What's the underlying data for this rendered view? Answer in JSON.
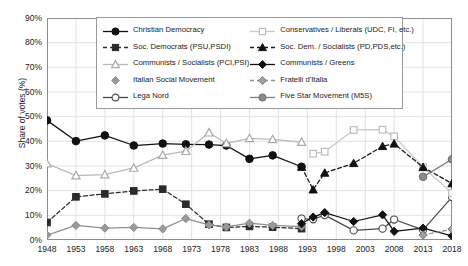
{
  "chart_data": {
    "type": "line",
    "title": "",
    "xlabel": "",
    "ylabel": "Share of votes (%)",
    "ylim": [
      0,
      90
    ],
    "ytick_labels": [
      "90%",
      "80%",
      "70%",
      "60%",
      "50%",
      "40%",
      "30%",
      "20%",
      "10%",
      "0%"
    ],
    "ytick_values": [
      90,
      80,
      70,
      60,
      50,
      40,
      30,
      20,
      10,
      0
    ],
    "grid": true,
    "legend_position": "upper-center",
    "categories": [
      1948,
      1953,
      1958,
      1963,
      1968,
      1973,
      1978,
      1983,
      1988,
      1993,
      1998,
      2003,
      2008,
      2013,
      2018
    ],
    "x": [
      1948,
      1953,
      1958,
      1963,
      1968,
      1972,
      1976,
      1979,
      1983,
      1987,
      1992,
      1994,
      1996,
      2001,
      2006,
      2008,
      2013,
      2018
    ],
    "series": [
      {
        "name": "Christian Democracy",
        "marker": "filled-circle",
        "color": "#111111",
        "line": "solid",
        "x": [
          1948,
          1953,
          1958,
          1963,
          1968,
          1972,
          1976,
          1979,
          1983,
          1987,
          1992
        ],
        "values": [
          48.5,
          40.1,
          42.4,
          38.3,
          39.1,
          38.8,
          38.7,
          38.3,
          32.9,
          34.3,
          29.7
        ]
      },
      {
        "name": "Soc. Democrats (PSU,PSDI)",
        "marker": "filled-square",
        "color": "#2b2b2b",
        "line": "dashed",
        "x": [
          1948,
          1953,
          1958,
          1963,
          1968,
          1972,
          1976,
          1979,
          1983,
          1987,
          1992
        ],
        "values": [
          7.1,
          17.5,
          18.7,
          19.9,
          20.6,
          14.5,
          6.4,
          5.1,
          5.5,
          5.2,
          4.6
        ]
      },
      {
        "name": "Communists / Socialists (PCI,PSI)",
        "marker": "open-triangle",
        "color": "#b8b8b8",
        "line": "solid",
        "x": [
          1948,
          1953,
          1958,
          1963,
          1968,
          1972,
          1976,
          1979,
          1983,
          1987,
          1992
        ],
        "values": [
          31.0,
          26.1,
          26.5,
          29.2,
          34.4,
          36.0,
          43.5,
          39.2,
          41.2,
          40.8,
          39.7
        ]
      },
      {
        "name": "Italian Social Movement",
        "marker": "filled-diamond-gray",
        "color": "#8e8e8e",
        "line": "solid",
        "x": [
          1948,
          1953,
          1958,
          1963,
          1968,
          1972,
          1976,
          1979,
          1983,
          1987,
          1992
        ],
        "values": [
          2.0,
          5.9,
          4.8,
          5.1,
          4.5,
          8.7,
          6.1,
          5.3,
          6.8,
          5.9,
          5.4
        ]
      },
      {
        "name": "Lega Nord",
        "marker": "open-circle",
        "color": "#4a4a4a",
        "line": "solid",
        "x": [
          1992,
          1994,
          1996,
          2001,
          2006,
          2008,
          2013,
          2018
        ],
        "values": [
          8.7,
          8.4,
          10.1,
          3.9,
          4.6,
          8.3,
          4.1,
          17.4
        ]
      },
      {
        "name": "Conservatives / Liberals (UDC, FI, etc.)",
        "marker": "open-square",
        "color": "#c9c9c9",
        "line": "solid",
        "x": [
          1994,
          1996,
          2001,
          2006,
          2008,
          2013,
          2018
        ],
        "values": [
          35.0,
          35.8,
          44.6,
          44.7,
          42.0,
          29.5,
          19.0
        ]
      },
      {
        "name": "Soc. Dem. / Socialists (PD,PDS,etc.)",
        "marker": "filled-triangle",
        "color": "#1a1a1a",
        "line": "dashed",
        "x": [
          1992,
          1994,
          1996,
          2001,
          2006,
          2008,
          2013,
          2018
        ],
        "values": [
          29.6,
          20.4,
          27.2,
          31.1,
          38.0,
          39.0,
          29.5,
          22.9
        ]
      },
      {
        "name": "Communists / Greens",
        "marker": "filled-diamond",
        "color": "#111111",
        "line": "solid",
        "x": [
          1992,
          1994,
          1996,
          2001,
          2006,
          2008,
          2013,
          2018
        ],
        "values": [
          6.6,
          9.3,
          11.1,
          7.5,
          10.2,
          3.5,
          4.8,
          1.7
        ]
      },
      {
        "name": "Fratelli d'Italia",
        "marker": "gray-diamond-open",
        "color": "#8e8e8e",
        "line": "dashed",
        "x": [
          2013,
          2018
        ],
        "values": [
          2.0,
          4.4
        ]
      },
      {
        "name": "Five Star Movement (M5S)",
        "marker": "gray-circle",
        "color": "#7d7d7d",
        "line": "solid",
        "x": [
          2013,
          2018
        ],
        "values": [
          25.6,
          32.7
        ]
      }
    ]
  },
  "legend": {
    "columns": [
      {
        "items": [
          {
            "label": "Christian Democracy",
            "marker": "filled-circle",
            "line": "solid",
            "color": "#111111"
          },
          {
            "label": "Soc. Democrats (PSU,PSDI)",
            "marker": "filled-square",
            "line": "dashed",
            "color": "#2b2b2b"
          },
          {
            "label": "Communists / Socialists (PCI,PSI)",
            "marker": "open-triangle",
            "line": "solid",
            "color": "#b8b8b8"
          },
          {
            "label": "Italian Social Movement",
            "marker": "filled-diamond-gray",
            "line": "none",
            "color": "#8e8e8e"
          },
          {
            "label": "Lega Nord",
            "marker": "open-circle",
            "line": "solid",
            "color": "#4a4a4a"
          }
        ]
      },
      {
        "items": [
          {
            "label": "Conservatives / Liberals (UDC, FI, etc.)",
            "marker": "open-square",
            "line": "solid",
            "color": "#c9c9c9"
          },
          {
            "label": "Soc. Dem. / Socialists (PD,PDS,etc.)",
            "marker": "filled-triangle",
            "line": "dashed",
            "color": "#1a1a1a"
          },
          {
            "label": "Communists / Greens",
            "marker": "filled-diamond",
            "line": "solid",
            "color": "#111111"
          },
          {
            "label": "Fratelli d'Italia",
            "marker": "gray-diamond-open",
            "line": "dashed",
            "color": "#8e8e8e"
          },
          {
            "label": "Five Star Movement (M5S)",
            "marker": "gray-circle",
            "line": "solid",
            "color": "#7d7d7d"
          }
        ]
      }
    ]
  },
  "colors": {
    "axis": "#8c8c8c",
    "grid": "#e2e2e2",
    "text": "#1a1a1a",
    "background": "#ffffff"
  }
}
